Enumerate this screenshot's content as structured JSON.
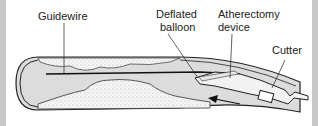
{
  "diagram": {
    "type": "medical-illustration",
    "labels": {
      "guidewire": "Guidewire",
      "deflated_balloon_line1": "Deflated",
      "deflated_balloon_line2": "balloon",
      "atherectomy_line1": "Atherectomy",
      "atherectomy_line2": "device",
      "cutter": "Cutter"
    },
    "colors": {
      "lumen": "#d9d9d9",
      "plaque": "#f2f2f2",
      "outline": "#222222",
      "frame": "#c8c8c8"
    }
  }
}
